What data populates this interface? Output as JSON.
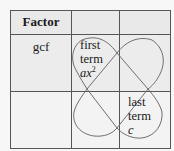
{
  "table": {
    "header": {
      "col1": "Factor",
      "col2": "",
      "col3": ""
    },
    "rows": [
      {
        "col1": "gcf",
        "col2": {
          "line1": "first",
          "line2": "term",
          "term_var": "ax",
          "term_exp": "2"
        },
        "col3": ""
      },
      {
        "col1": "",
        "col2": "",
        "col3": {
          "line1": "last",
          "line2": "term",
          "term_var": "c"
        }
      }
    ]
  },
  "diagram": {
    "shape": "loops",
    "colors": {
      "grid_line": "#555555",
      "loop_stroke": "#6e6e6e",
      "header_bg": "#e9e9e9",
      "cell_bg": "#ececec",
      "empty_cell_bg": "#f3f3f3"
    }
  }
}
